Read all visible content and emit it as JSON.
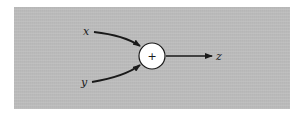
{
  "diagram": {
    "type": "summing-junction",
    "inputs": [
      {
        "label": "x"
      },
      {
        "label": "y"
      }
    ],
    "node": {
      "symbol": "+"
    },
    "output": {
      "label": "z"
    }
  },
  "colors": {
    "panel": "#bcbcbc",
    "stroke": "#1a1a1a",
    "node_fill": "#ffffff"
  }
}
